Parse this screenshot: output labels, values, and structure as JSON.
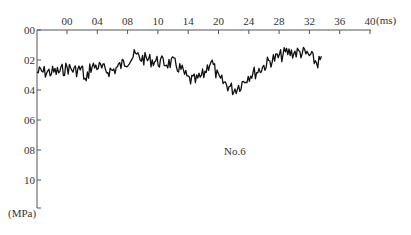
{
  "chart_data": {
    "type": "line",
    "title": "",
    "annotation": "No.6",
    "xlabel": "(ms)",
    "ylabel": "(MPa)",
    "x_ticks": [
      "00",
      "04",
      "08",
      "10",
      "14",
      "20",
      "24",
      "28",
      "32",
      "36",
      "40"
    ],
    "y_ticks": [
      "00",
      "02",
      "04",
      "06",
      "08",
      "10"
    ],
    "xlim": [
      0,
      40
    ],
    "ylim_inverted": [
      0,
      1.2
    ],
    "grid": false,
    "legend": null,
    "series": [
      {
        "name": "No.6",
        "color": "#111111",
        "x_ms": [
          -1.0,
          0.0,
          1.0,
          2.0,
          2.5,
          3.0,
          4.0,
          5.0,
          6.0,
          7.0,
          8.0,
          9.0,
          10.0,
          11.0,
          12.0,
          13.0,
          14.0,
          15.0,
          16.0,
          17.0,
          18.0,
          19.0,
          20.0,
          21.0,
          22.0,
          23.0,
          24.0,
          25.0,
          26.0,
          27.0,
          28.0,
          29.0,
          30.0,
          31.0,
          32.0,
          33.0,
          33.6
        ],
        "pressure_mpa": [
          0.28,
          0.25,
          0.27,
          0.26,
          0.36,
          0.25,
          0.24,
          0.27,
          0.27,
          0.24,
          0.2,
          0.17,
          0.19,
          0.2,
          0.21,
          0.22,
          0.22,
          0.26,
          0.33,
          0.34,
          0.3,
          0.2,
          0.33,
          0.36,
          0.4,
          0.36,
          0.3,
          0.28,
          0.24,
          0.2,
          0.18,
          0.15,
          0.15,
          0.15,
          0.17,
          0.22,
          0.2
        ]
      }
    ]
  }
}
